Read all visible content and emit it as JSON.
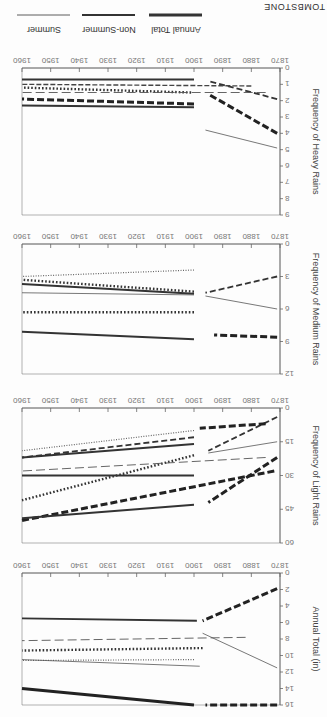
{
  "figure": {
    "station": "TOMBSTONE",
    "legend": [
      {
        "label": "Annual Total",
        "style": "thick-solid"
      },
      {
        "label": "Non-Summer",
        "style": "medium-solid"
      },
      {
        "label": "Summer",
        "style": "thin-solid"
      }
    ],
    "orientation": "rotated 180 degrees"
  },
  "chart_data": [
    {
      "type": "line",
      "title": "Frequency of Heavy Rains",
      "xlabel": "",
      "ylabel": "Frequency of Heavy Rains",
      "x_ticks": [
        1870,
        1880,
        1890,
        1900,
        1910,
        1920,
        1930,
        1940,
        1950,
        1960
      ],
      "y_ticks": [
        0,
        1,
        2,
        3,
        4,
        5,
        6,
        7,
        8,
        9
      ],
      "ylim": [
        0,
        9
      ],
      "xlim": [
        1870,
        1960
      ],
      "grid": false,
      "series": [
        {
          "name": "thick-dashed-a",
          "style": "thick-dash",
          "x": [
            1871,
            1895
          ],
          "y": [
            4.0,
            1.6
          ]
        },
        {
          "name": "thick-dashed-a-late",
          "style": "thick-dash",
          "x": [
            1900,
            1960
          ],
          "y": [
            2.2,
            1.9
          ]
        },
        {
          "name": "dash-b",
          "style": "dash",
          "x": [
            1871,
            1895
          ],
          "y": [
            1.9,
            0.8
          ]
        },
        {
          "name": "thin-c",
          "style": "thin",
          "x": [
            1871,
            1896
          ],
          "y": [
            4.9,
            3.8
          ]
        },
        {
          "name": "solid-d",
          "style": "solid",
          "x": [
            1900,
            1960
          ],
          "y": [
            0.7,
            0.7
          ]
        },
        {
          "name": "solid-e",
          "style": "solid",
          "x": [
            1900,
            1960
          ],
          "y": [
            2.4,
            2.3
          ]
        },
        {
          "name": "dotted-f",
          "style": "dot",
          "x": [
            1901,
            1960
          ],
          "y": [
            1.5,
            1.2
          ]
        },
        {
          "name": "dash-dot-g",
          "style": "dash-thin",
          "x": [
            1880,
            1960
          ],
          "y": [
            1.1,
            1.0
          ]
        },
        {
          "name": "thin-h",
          "style": "thin-dash",
          "x": [
            1875,
            1960
          ],
          "y": [
            1.5,
            1.5
          ]
        }
      ]
    },
    {
      "type": "line",
      "title": "Frequency of Medium Rains",
      "ylabel": "Frequency of Medium Rains",
      "x_ticks": [
        1870,
        1880,
        1890,
        1900,
        1910,
        1920,
        1930,
        1940,
        1950,
        1960
      ],
      "y_ticks": [
        0,
        3,
        6,
        9,
        12
      ],
      "ylim": [
        0,
        12
      ],
      "xlim": [
        1870,
        1960
      ],
      "grid": false,
      "series": [
        {
          "name": "dash-a",
          "style": "dash",
          "x": [
            1871,
            1896
          ],
          "y": [
            3.0,
            4.5
          ]
        },
        {
          "name": "thin-b",
          "style": "thin",
          "x": [
            1871,
            1896
          ],
          "y": [
            6.0,
            4.8
          ]
        },
        {
          "name": "thick-dash-c",
          "style": "thick-dash",
          "x": [
            1871,
            1893
          ],
          "y": [
            8.6,
            8.4
          ]
        },
        {
          "name": "solid-d",
          "style": "solid",
          "x": [
            1900,
            1960
          ],
          "y": [
            8.8,
            8.1
          ]
        },
        {
          "name": "dotted-e",
          "style": "dot",
          "x": [
            1900,
            1960
          ],
          "y": [
            6.3,
            6.3
          ]
        },
        {
          "name": "solid-f",
          "style": "solid",
          "x": [
            1900,
            1960
          ],
          "y": [
            4.6,
            3.7
          ]
        },
        {
          "name": "thin-g",
          "style": "thin",
          "x": [
            1900,
            1960
          ],
          "y": [
            4.7,
            4.5
          ]
        },
        {
          "name": "dotted-h",
          "style": "dot",
          "x": [
            1900,
            1960
          ],
          "y": [
            4.4,
            3.3
          ]
        },
        {
          "name": "thin-dot-i",
          "style": "thin-dot",
          "x": [
            1900,
            1960
          ],
          "y": [
            2.4,
            3.0
          ]
        }
      ]
    },
    {
      "type": "line",
      "title": "Frequency of Light Rains",
      "ylabel": "Frequency of Light Rains",
      "x_ticks": [
        1870,
        1880,
        1890,
        1900,
        1910,
        1920,
        1930,
        1940,
        1950,
        1960
      ],
      "y_ticks": [
        0,
        15,
        30,
        45,
        60
      ],
      "ylim": [
        0,
        60
      ],
      "xlim": [
        1870,
        1960
      ],
      "grid": false,
      "series": [
        {
          "name": "dash-a",
          "style": "dash",
          "x": [
            1871,
            1895
          ],
          "y": [
            4,
            19
          ]
        },
        {
          "name": "dash-a-late",
          "style": "thick-dash",
          "x": [
            1875,
            1898
          ],
          "y": [
            7,
            9
          ]
        },
        {
          "name": "thin-b",
          "style": "thin",
          "x": [
            1871,
            1895
          ],
          "y": [
            15,
            20
          ]
        },
        {
          "name": "thick-dash-c",
          "style": "thick-dash",
          "x": [
            1871,
            1895
          ],
          "y": [
            22,
            42
          ]
        },
        {
          "name": "thick-dash-d",
          "style": "thick-dash",
          "x": [
            1872,
            1960
          ],
          "y": [
            28,
            50
          ]
        },
        {
          "name": "solid-e",
          "style": "solid",
          "x": [
            1900,
            1960
          ],
          "y": [
            43,
            49
          ]
        },
        {
          "name": "dotted-f",
          "style": "dot",
          "x": [
            1900,
            1960
          ],
          "y": [
            21,
            41
          ]
        },
        {
          "name": "solid-g",
          "style": "solid",
          "x": [
            1900,
            1960
          ],
          "y": [
            30,
            30
          ]
        },
        {
          "name": "thin-dash-h",
          "style": "thin-dash",
          "x": [
            1875,
            1960
          ],
          "y": [
            22,
            28
          ]
        },
        {
          "name": "solid-i",
          "style": "solid",
          "x": [
            1900,
            1960
          ],
          "y": [
            16,
            22
          ]
        },
        {
          "name": "dotted-j",
          "style": "thin-dot",
          "x": [
            1900,
            1960
          ],
          "y": [
            10,
            19
          ]
        },
        {
          "name": "dash-k",
          "style": "dash",
          "x": [
            1900,
            1960
          ],
          "y": [
            13,
            22
          ]
        }
      ]
    },
    {
      "type": "line",
      "title": "Annual Total (in)",
      "ylabel": "Annual Total (in)",
      "x_ticks": [
        1870,
        1880,
        1890,
        1900,
        1910,
        1920,
        1930,
        1940,
        1950,
        1960
      ],
      "y_ticks": [
        0,
        2,
        4,
        6,
        8,
        10,
        12,
        14,
        16
      ],
      "ylim": [
        0,
        16
      ],
      "xlim": [
        1870,
        1960
      ],
      "grid": false,
      "series": [
        {
          "name": "dash-a",
          "style": "thick-dash",
          "x": [
            1871,
            1897
          ],
          "y": [
            1.9,
            5.8
          ]
        },
        {
          "name": "thin-b",
          "style": "thin",
          "x": [
            1871,
            1897
          ],
          "y": [
            11.5,
            7.3
          ]
        },
        {
          "name": "thin-dash-c",
          "style": "thin-dash",
          "x": [
            1882,
            1960
          ],
          "y": [
            7.8,
            8.2
          ]
        },
        {
          "name": "thick-dash-d",
          "style": "thick-dash",
          "x": [
            1871,
            1896
          ],
          "y": [
            16.0,
            16.0
          ]
        },
        {
          "name": "solid-e",
          "style": "solid",
          "x": [
            1899,
            1960
          ],
          "y": [
            5.8,
            5.5
          ]
        },
        {
          "name": "dotted-f",
          "style": "dot",
          "x": [
            1897,
            1960
          ],
          "y": [
            9.1,
            9.4
          ]
        },
        {
          "name": "thin-dot-g",
          "style": "thin-dot",
          "x": [
            1900,
            1960
          ],
          "y": [
            10.5,
            10.6
          ]
        },
        {
          "name": "thin-h",
          "style": "thin",
          "x": [
            1898,
            1960
          ],
          "y": [
            11.3,
            10.5
          ]
        },
        {
          "name": "thick-solid-i",
          "style": "thick-solid",
          "x": [
            1900,
            1960
          ],
          "y": [
            16.0,
            14.0
          ]
        }
      ]
    }
  ]
}
